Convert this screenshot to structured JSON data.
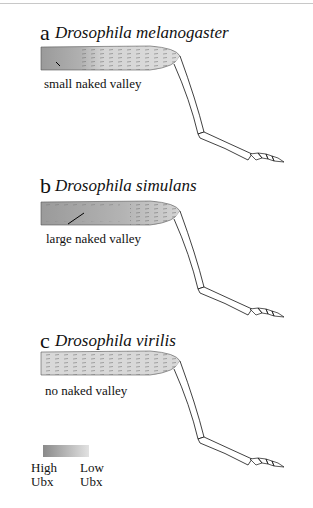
{
  "figure": {
    "panels": [
      {
        "letter": "a",
        "species": "Drosophila melanogaster",
        "annotation": "small naked valley"
      },
      {
        "letter": "b",
        "species": "Drosophila simulans",
        "annotation": "large naked valley"
      },
      {
        "letter": "c",
        "species": "Drosophila virilis",
        "annotation": "no naked valley"
      }
    ],
    "legend": {
      "high_line1": "High",
      "high_line2": "Ubx",
      "low_line1": "Low",
      "low_line2": "Ubx",
      "gradient_start": "#8a8a8a",
      "gradient_end": "#e2e2e2"
    }
  }
}
